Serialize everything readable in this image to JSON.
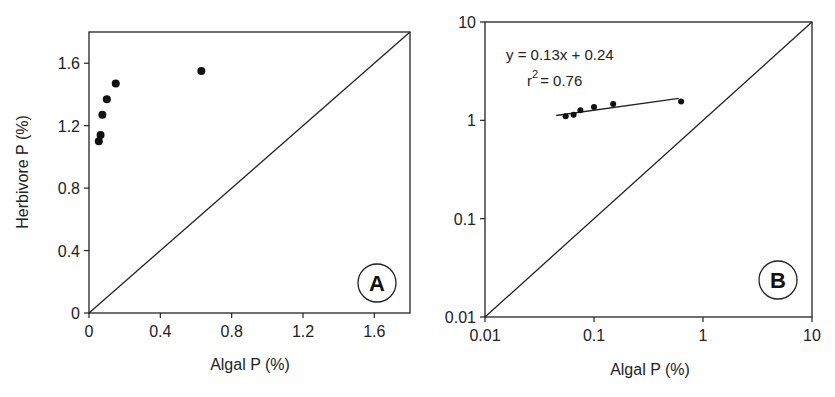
{
  "chart_data": [
    {
      "panel": "A",
      "type": "scatter",
      "title": "",
      "xlabel": "Algal P (%)",
      "ylabel": "Herbivore P (%)",
      "xlim": [
        0,
        1.8
      ],
      "ylim": [
        0,
        1.8
      ],
      "x_ticks": [
        "0",
        "0.4",
        "0.8",
        "1.2",
        "1.6"
      ],
      "y_ticks": [
        "0",
        "0.4",
        "0.8",
        "1.2",
        "1.6"
      ],
      "grid": false,
      "reference_line": "1:1",
      "series": [
        {
          "name": "data",
          "x": [
            0.055,
            0.065,
            0.075,
            0.1,
            0.15,
            0.63
          ],
          "y": [
            1.1,
            1.14,
            1.27,
            1.37,
            1.47,
            1.55
          ]
        }
      ],
      "annotation": "A"
    },
    {
      "panel": "B",
      "type": "scatter",
      "title": "",
      "xlabel": "Algal P (%)",
      "ylabel": "",
      "xscale": "log",
      "yscale": "log",
      "xlim": [
        0.01,
        10
      ],
      "ylim": [
        0.01,
        10
      ],
      "x_ticks": [
        "0.01",
        "0.1",
        "1",
        "10"
      ],
      "y_ticks": [
        "0.01",
        "0.1",
        "1",
        "10"
      ],
      "grid": false,
      "reference_line": "1:1",
      "series": [
        {
          "name": "data",
          "x": [
            0.055,
            0.065,
            0.075,
            0.1,
            0.15,
            0.63
          ],
          "y": [
            1.1,
            1.14,
            1.27,
            1.37,
            1.47,
            1.55
          ]
        }
      ],
      "fit": {
        "equation": "y = 0.13x + 0.24",
        "r2_label": "r",
        "r2_sup": "2",
        "r2_value": "= 0.76",
        "x_range": [
          0.045,
          0.6
        ],
        "y_range": [
          1.12,
          1.67
        ]
      },
      "annotation": "B"
    }
  ]
}
